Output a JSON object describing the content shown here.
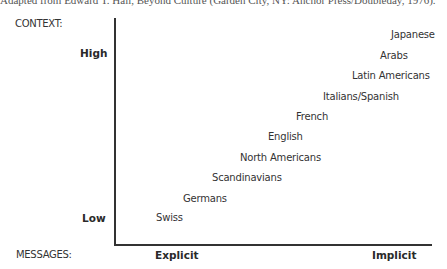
{
  "citation": "Adapted from Edward T. Hall, Beyond Culture (Garden City, NY: Anchor Press/Doubleday, 1976).",
  "labels": {
    "context": "CONTEXT:",
    "messages": "MESSAGES:",
    "high": "High",
    "low": "Low",
    "explicit": "Explicit",
    "implicit": "Implicit"
  },
  "chart_data": {
    "type": "scatter",
    "title": "",
    "xlabel": "MESSAGES: Explicit → Implicit",
    "ylabel": "CONTEXT: Low → High",
    "x_ticks": [
      "Explicit",
      "Implicit"
    ],
    "y_ticks": [
      "Low",
      "High"
    ],
    "grid": false,
    "legend": "none",
    "points": [
      {
        "label": "Swiss",
        "rank": 1
      },
      {
        "label": "Germans",
        "rank": 2
      },
      {
        "label": "Scandinavians",
        "rank": 3
      },
      {
        "label": "North Americans",
        "rank": 4
      },
      {
        "label": "English",
        "rank": 5
      },
      {
        "label": "French",
        "rank": 6
      },
      {
        "label": "Italians/Spanish",
        "rank": 7
      },
      {
        "label": "Latin Americans",
        "rank": 8
      },
      {
        "label": "Arabs",
        "rank": 9
      },
      {
        "label": "Japanese",
        "rank": 10
      }
    ]
  },
  "cultures": [
    {
      "label": "Japanese",
      "x": 391,
      "y": 29
    },
    {
      "label": "Arabs",
      "x": 380,
      "y": 50
    },
    {
      "label": "Latin Americans",
      "x": 352,
      "y": 70
    },
    {
      "label": "Italians/Spanish",
      "x": 323,
      "y": 91
    },
    {
      "label": "French",
      "x": 296,
      "y": 111
    },
    {
      "label": "English",
      "x": 268,
      "y": 131
    },
    {
      "label": "North Americans",
      "x": 240,
      "y": 152
    },
    {
      "label": "Scandinavians",
      "x": 212,
      "y": 172
    },
    {
      "label": "Germans",
      "x": 183,
      "y": 193
    },
    {
      "label": "Swiss",
      "x": 156,
      "y": 212
    }
  ]
}
